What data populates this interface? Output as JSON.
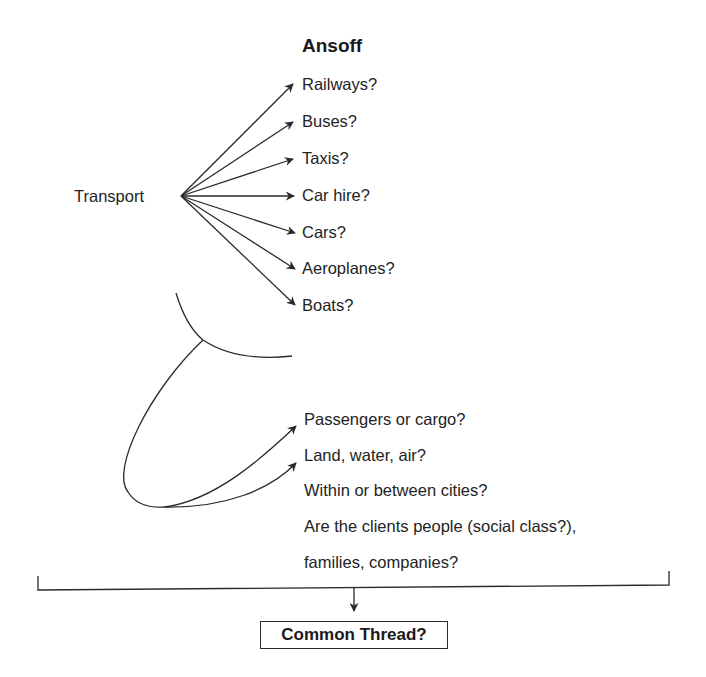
{
  "diagram": {
    "title": "Ansoff",
    "root": "Transport",
    "branches": [
      {
        "label": "Railways?"
      },
      {
        "label": "Buses?"
      },
      {
        "label": "Taxis?"
      },
      {
        "label": "Car hire?"
      },
      {
        "label": "Cars?"
      },
      {
        "label": "Aeroplanes?"
      },
      {
        "label": "Boats?"
      }
    ],
    "questions": [
      {
        "label": "Passengers or cargo?"
      },
      {
        "label": "Land, water, air?"
      },
      {
        "label": "Within or between cities?"
      },
      {
        "label": "Are the clients people (social class?),"
      },
      {
        "label": "families, companies?"
      }
    ],
    "conclusion": "Common Thread?",
    "colors": {
      "stroke": "#2a2a2a",
      "text": "#232323",
      "background": "#ffffff"
    }
  }
}
